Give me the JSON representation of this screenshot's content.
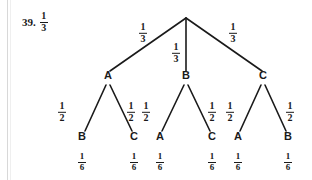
{
  "page": {
    "background_color": "#ffffff",
    "ink_color": "#1a1a1a",
    "margin_rule_color": "#d8d8d8"
  },
  "problem": {
    "number": "39.",
    "answer": {
      "numerator": "1",
      "denominator": "3"
    }
  },
  "chart_data": {
    "type": "diagram",
    "diagram_type": "probability-tree",
    "title": "",
    "root": {
      "label": "",
      "x": 186,
      "y": 17
    },
    "levels": [
      {
        "name": "first-draw",
        "edge_probability": {
          "numerator": "1",
          "denominator": "3"
        },
        "nodes": [
          {
            "id": "L1-A",
            "label": "A",
            "x": 108,
            "y": 80,
            "edge_label_x": 143,
            "edge_label_y": 30
          },
          {
            "id": "L1-B",
            "label": "B",
            "x": 186,
            "y": 80,
            "edge_label_x": 176,
            "edge_label_y": 50
          },
          {
            "id": "L1-C",
            "label": "C",
            "x": 263,
            "y": 80,
            "edge_label_x": 233,
            "edge_label_y": 30
          }
        ]
      },
      {
        "name": "second-draw",
        "edge_probability": {
          "numerator": "1",
          "denominator": "2"
        },
        "nodes": [
          {
            "id": "L2-B",
            "label": "B",
            "parent": "L1-A",
            "x": 82,
            "y": 141,
            "edge_label_x": 62,
            "edge_label_y": 109,
            "prob": {
              "numerator": "1",
              "denominator": "6"
            }
          },
          {
            "id": "L2-C",
            "label": "C",
            "parent": "L1-A",
            "x": 134,
            "y": 141,
            "edge_label_x": 131,
            "edge_label_y": 109,
            "prob": {
              "numerator": "1",
              "denominator": "6"
            }
          },
          {
            "id": "L2-A",
            "label": "A",
            "parent": "L1-B",
            "x": 160,
            "y": 141,
            "edge_label_x": 146,
            "edge_label_y": 109,
            "prob": {
              "numerator": "1",
              "denominator": "6"
            }
          },
          {
            "id": "L2-C2",
            "label": "C",
            "parent": "L1-B",
            "x": 212,
            "y": 141,
            "edge_label_x": 212,
            "edge_label_y": 109,
            "prob": {
              "numerator": "1",
              "denominator": "6"
            }
          },
          {
            "id": "L2-A2",
            "label": "A",
            "parent": "L1-C",
            "x": 238,
            "y": 141,
            "edge_label_x": 230,
            "edge_label_y": 109,
            "prob": {
              "numerator": "1",
              "denominator": "6"
            }
          },
          {
            "id": "L2-B2",
            "label": "B",
            "parent": "L1-C",
            "x": 288,
            "y": 141,
            "edge_label_x": 290,
            "edge_label_y": 109,
            "prob": {
              "numerator": "1",
              "denominator": "6"
            }
          }
        ]
      }
    ],
    "leaf_outcomes": [
      "AB",
      "AC",
      "BA",
      "BC",
      "CA",
      "CB"
    ],
    "leaf_probabilities": [
      "1/6",
      "1/6",
      "1/6",
      "1/6",
      "1/6",
      "1/6"
    ],
    "branch_probabilities_level1": [
      "1/3",
      "1/3",
      "1/3"
    ],
    "branch_probabilities_level2": [
      "1/2",
      "1/2",
      "1/2",
      "1/2",
      "1/2",
      "1/2"
    ],
    "edges": [
      {
        "from": "root",
        "to": "L1-A",
        "x1": 186,
        "y1": 18,
        "x2": 110,
        "y2": 71
      },
      {
        "from": "root",
        "to": "L1-B",
        "x1": 186,
        "y1": 18,
        "x2": 186,
        "y2": 71
      },
      {
        "from": "root",
        "to": "L1-C",
        "x1": 186,
        "y1": 18,
        "x2": 262,
        "y2": 71
      },
      {
        "from": "L1-A",
        "to": "L2-B",
        "x1": 106,
        "y1": 85,
        "x2": 85,
        "y2": 131
      },
      {
        "from": "L1-A",
        "to": "L2-C",
        "x1": 110,
        "y1": 85,
        "x2": 132,
        "y2": 131
      },
      {
        "from": "L1-B",
        "to": "L2-A",
        "x1": 184,
        "y1": 85,
        "x2": 162,
        "y2": 131
      },
      {
        "from": "L1-B",
        "to": "L2-C2",
        "x1": 188,
        "y1": 85,
        "x2": 210,
        "y2": 131
      },
      {
        "from": "L1-C",
        "to": "L2-A2",
        "x1": 261,
        "y1": 85,
        "x2": 240,
        "y2": 131
      },
      {
        "from": "L1-C",
        "to": "L2-B2",
        "x1": 265,
        "y1": 85,
        "x2": 286,
        "y2": 131
      }
    ]
  }
}
